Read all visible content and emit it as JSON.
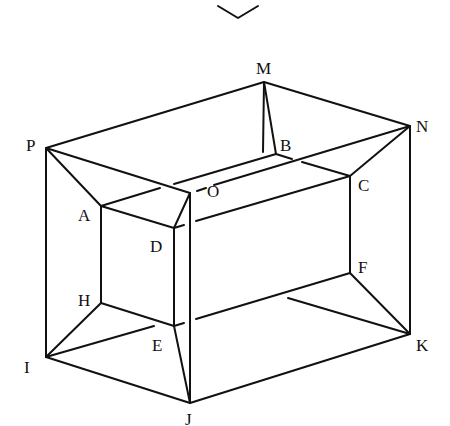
{
  "diagram": {
    "type": "3D wireframe prism-in-box line drawing",
    "stroke_color": "#111111",
    "background_color": "#ffffff",
    "top_glyph": "chevron-down (diamond fragment)",
    "vertices": {
      "P": {
        "label": "P",
        "x": 46,
        "y": 148
      },
      "M": {
        "label": "M",
        "x": 264,
        "y": 82
      },
      "N": {
        "label": "N",
        "x": 410,
        "y": 126
      },
      "A": {
        "label": "A",
        "x": 101,
        "y": 206
      },
      "B": {
        "label": "B",
        "x": 276,
        "y": 154
      },
      "C": {
        "label": "C",
        "x": 350,
        "y": 176
      },
      "D": {
        "label": "D",
        "x": 174,
        "y": 228
      },
      "O": {
        "label": "O",
        "x": 190,
        "y": 193
      },
      "H": {
        "label": "H",
        "x": 101,
        "y": 303
      },
      "E": {
        "label": "E",
        "x": 174,
        "y": 326
      },
      "F": {
        "label": "F",
        "x": 350,
        "y": 273
      },
      "I": {
        "label": "I",
        "x": 46,
        "y": 357
      },
      "J": {
        "label": "J",
        "x": 190,
        "y": 403
      },
      "K": {
        "label": "K",
        "x": 410,
        "y": 334
      }
    },
    "labels": [
      {
        "text": "M",
        "x": 256,
        "y": 60
      },
      {
        "text": "N",
        "x": 416,
        "y": 118
      },
      {
        "text": "P",
        "x": 26,
        "y": 137
      },
      {
        "text": "B",
        "x": 280,
        "y": 137
      },
      {
        "text": "O",
        "x": 207,
        "y": 183
      },
      {
        "text": "C",
        "x": 358,
        "y": 177
      },
      {
        "text": "A",
        "x": 78,
        "y": 207
      },
      {
        "text": "D",
        "x": 150,
        "y": 238
      },
      {
        "text": "F",
        "x": 358,
        "y": 259
      },
      {
        "text": "H",
        "x": 78,
        "y": 292
      },
      {
        "text": "E",
        "x": 152,
        "y": 337
      },
      {
        "text": "K",
        "x": 416,
        "y": 337
      },
      {
        "text": "I",
        "x": 24,
        "y": 359
      },
      {
        "text": "J",
        "x": 185,
        "y": 411
      }
    ]
  }
}
